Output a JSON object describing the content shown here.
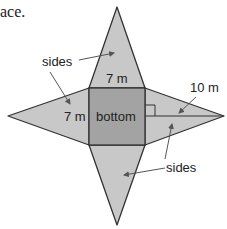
{
  "caption_fragment": "ace.",
  "diagram": {
    "type": "square pyramid net",
    "labels": {
      "sides_top": "sides",
      "sides_bottom": "sides",
      "top_base": "7 m",
      "left_base": "7 m",
      "bottom_face": "bottom",
      "slant_height": "10 m"
    },
    "colors": {
      "side_fill": "#c8c8c8",
      "bottom_fill": "#a3a3a3",
      "stroke": "#333333",
      "arrow": "#555555",
      "text": "#222222"
    }
  }
}
